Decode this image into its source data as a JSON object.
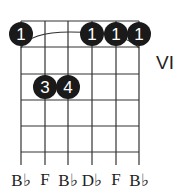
{
  "chord": {
    "position_label": "VI",
    "string_labels": [
      "B♭",
      "F",
      "B♭",
      "D♭",
      "F",
      "B♭"
    ],
    "barre": {
      "finger": "1",
      "from_string": 1,
      "to_string": 6,
      "fret": 1
    },
    "dots": [
      {
        "string": 1,
        "fret": 1,
        "finger": "1"
      },
      {
        "string": 4,
        "fret": 1,
        "finger": "1"
      },
      {
        "string": 5,
        "fret": 1,
        "finger": "1"
      },
      {
        "string": 6,
        "fret": 1,
        "finger": "1"
      },
      {
        "string": 2,
        "fret": 3,
        "finger": "3"
      },
      {
        "string": 3,
        "fret": 3,
        "finger": "4"
      }
    ],
    "num_strings": 6,
    "num_frets": 5,
    "dot_color": "#1a1a1a",
    "line_color": "#333333"
  }
}
